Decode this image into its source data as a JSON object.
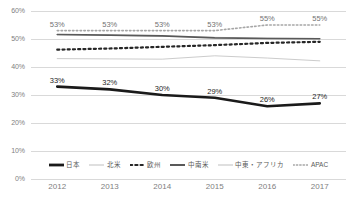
{
  "chart_data": {
    "type": "line",
    "title": "",
    "subtitle": "",
    "xlabel": "",
    "ylabel": "",
    "x": [
      "2012",
      "2013",
      "2014",
      "2015",
      "2016",
      "2017"
    ],
    "categories": [
      "2012",
      "2013",
      "2014",
      "2015",
      "2016",
      "2017"
    ],
    "ylim": [
      0,
      60
    ],
    "y_ticks": [
      "0%",
      "10%",
      "20%",
      "30%",
      "40%",
      "50%",
      "60%"
    ],
    "y_tick_values": [
      0,
      10,
      20,
      30,
      40,
      50,
      60
    ],
    "grid": true,
    "legend_position": "bottom",
    "series": [
      {
        "name": "日本",
        "values": [
          33,
          32,
          30,
          29,
          26,
          27
        ],
        "labels": [
          "33%",
          "32%",
          "30%",
          "29%",
          "26%",
          "27%"
        ],
        "show_labels": true,
        "style": "solid",
        "color": "#1a1a1a",
        "width": 2.6
      },
      {
        "name": "北米",
        "values": [
          51.5,
          51.3,
          51.0,
          50.6,
          50.3,
          50.2
        ],
        "labels": [
          "",
          "",
          "",
          "",
          "",
          ""
        ],
        "show_labels": false,
        "style": "solid",
        "color": "#bfbfbf",
        "width": 1.0
      },
      {
        "name": "欧州",
        "values": [
          46.2,
          46.6,
          47.2,
          47.8,
          48.6,
          49.0
        ],
        "labels": [
          "",
          "",
          "",
          "",
          "",
          ""
        ],
        "show_labels": false,
        "style": "dotted",
        "color": "#262626",
        "width": 2.2
      },
      {
        "name": "中南米",
        "values": [
          51.6,
          51.4,
          51.1,
          50.4,
          50.2,
          50.1
        ],
        "labels": [
          "",
          "",
          "",
          "",
          "",
          ""
        ],
        "show_labels": false,
        "style": "solid",
        "color": "#595959",
        "width": 1.6
      },
      {
        "name": "中東・アフリカ",
        "values": [
          43.0,
          42.9,
          42.8,
          44.0,
          43.2,
          42.2
        ],
        "labels": [
          "",
          "",
          "",
          "",
          "",
          ""
        ],
        "show_labels": false,
        "style": "solid",
        "color": "#cccccc",
        "width": 1.0
      },
      {
        "name": "APAC",
        "values": [
          53,
          53,
          53,
          53,
          55,
          55
        ],
        "labels": [
          "53%",
          "53%",
          "53%",
          "53%",
          "55%",
          "55%"
        ],
        "show_labels": true,
        "style": "dotted",
        "color": "#a6a6a6",
        "width": 1.6
      }
    ]
  },
  "legend": {
    "items": [
      {
        "label": "日本",
        "style": "solid",
        "color": "#1a1a1a",
        "width": 2.8
      },
      {
        "label": "北米",
        "style": "solid",
        "color": "#bfbfbf",
        "width": 1.0
      },
      {
        "label": "欧州",
        "style": "dotted",
        "color": "#262626",
        "width": 2.2
      },
      {
        "label": "中南米",
        "style": "solid",
        "color": "#595959",
        "width": 2.0
      },
      {
        "label": "中東・アフリカ",
        "style": "solid",
        "color": "#bfbfbf",
        "width": 1.0
      },
      {
        "label": "APAC",
        "style": "dotted",
        "color": "#a6a6a6",
        "width": 1.4
      }
    ]
  },
  "colors": {
    "background": "#ffffff",
    "gridline": "#d9d9d9",
    "axis_text": "#808080",
    "label_text": "#404040"
  }
}
